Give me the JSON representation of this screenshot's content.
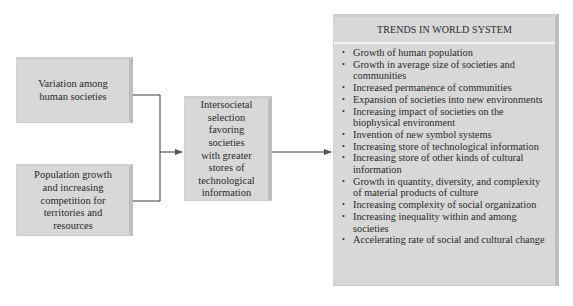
{
  "diagram": {
    "inputs": [
      {
        "id": "variation",
        "label": "Variation among human societies",
        "lines": [
          "Variation among",
          "human societies"
        ]
      },
      {
        "id": "population",
        "label": "Population growth and increasing competition for territories and resources",
        "lines": [
          "Population growth",
          "and increasing",
          "competition for",
          "territories and",
          "resources"
        ]
      }
    ],
    "process": {
      "label": "Intersocietal selection favoring societies with greater stores of technological information",
      "lines": [
        "Intersocietal",
        "selection",
        "favoring",
        "societies",
        "with greater",
        "stores of",
        "technological",
        "information"
      ]
    },
    "output": {
      "title": "TRENDS IN WORLD SYSTEM",
      "bullet": "•",
      "items": [
        "Growth of human population",
        "Growth in average size of societies and communities",
        "Increased permanence of communities",
        "Expansion of societies into new environments",
        "Increasing impact of societies on the biophysical environment",
        "Invention of new symbol systems",
        "Increasing store of technological information",
        "Increasing store of other kinds of cultural information",
        "Growth in quantity, diversity, and complexity of material products of culture",
        "Increasing complexity of social organization",
        "Increasing inequality within and among societies",
        "Accelerating rate of social and cultural change"
      ]
    },
    "colors": {
      "box_fill": "#d8d8d8",
      "box_shadow_edge": "#bdbdbd",
      "line": "#3a3a3a",
      "text": "#2a2a2a"
    }
  }
}
